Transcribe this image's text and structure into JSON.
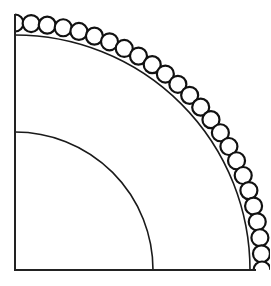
{
  "diagram": {
    "title": "",
    "canvas": {
      "width": 270,
      "height": 286,
      "background": "#ffffff"
    },
    "origin": {
      "x": 15,
      "y": 270
    },
    "axes": {
      "vertical": {
        "x": 15,
        "y_top": 15,
        "y_bottom": 270
      },
      "horizontal": {
        "y": 270,
        "x_left": 15,
        "x_right": 255
      },
      "color": "#222222"
    },
    "arcs": [
      {
        "name": "inner-arc",
        "radius": 138,
        "color": "#1a1a1a"
      },
      {
        "name": "middle-arc",
        "radius": 235,
        "color": "#1a1a1a"
      }
    ],
    "bead_ring": {
      "center_radius": 247,
      "bead_radius": 8.5,
      "count": 25,
      "stroke_color": "#111111",
      "fill_color": "#ffffff"
    },
    "labels": []
  }
}
